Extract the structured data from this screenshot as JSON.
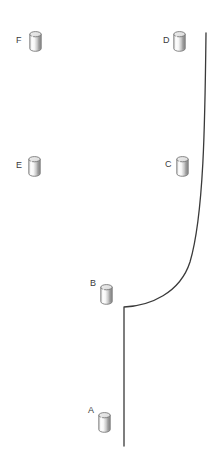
{
  "diagram": {
    "background_color": "#ffffff",
    "stroke_color": "#3a3a3a",
    "label_color": "#3b3b3b",
    "cylinder_colors": {
      "top_fill": "#e9e9e9",
      "body_light": "#f2f2f2",
      "body_mid": "#b9b9b9",
      "body_dark": "#8f8f8f",
      "outline": "#6b6b6b"
    },
    "markers": [
      {
        "label": "A",
        "label_x": 88,
        "label_y": 406,
        "cyl_x": 98,
        "cyl_y": 412
      },
      {
        "label": "B",
        "label_x": 90,
        "label_y": 279,
        "cyl_x": 100,
        "cyl_y": 284
      },
      {
        "label": "C",
        "label_x": 165,
        "label_y": 160,
        "cyl_x": 176,
        "cyl_y": 156
      },
      {
        "label": "D",
        "label_x": 163,
        "label_y": 36,
        "cyl_x": 173,
        "cyl_y": 31
      },
      {
        "label": "E",
        "label_x": 16,
        "label_y": 161,
        "cyl_x": 28,
        "cyl_y": 156
      },
      {
        "label": "F",
        "label_x": 16,
        "label_y": 36,
        "cyl_x": 29,
        "cyl_y": 31
      }
    ],
    "curve": {
      "type": "polyline-with-bezier",
      "stroke_width": 1.3,
      "path": "M 206 33 C 205 120 204 215 190 262 C 180 293 150 306 124 307 L 124 446",
      "points": [
        {
          "x": 206,
          "y": 33
        },
        {
          "x": 204,
          "y": 150
        },
        {
          "x": 199,
          "y": 240
        },
        {
          "x": 185,
          "y": 272
        },
        {
          "x": 150,
          "y": 303
        },
        {
          "x": 124,
          "y": 307
        },
        {
          "x": 124,
          "y": 446
        }
      ]
    }
  }
}
